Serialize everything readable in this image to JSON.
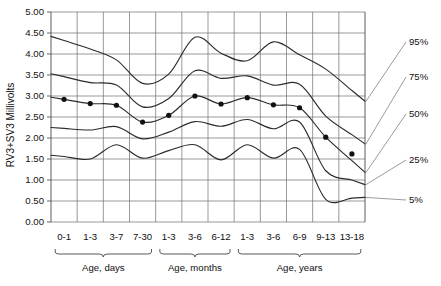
{
  "chart_data": {
    "type": "line",
    "title": "",
    "xlabel": "",
    "ylabel": "RV3+SV3 Millivolts",
    "ylim": [
      0.0,
      5.0
    ],
    "ytick_step": 0.5,
    "grid": true,
    "legend_position": "right-annotations",
    "categories": [
      "0-1",
      "1-3",
      "3-7",
      "7-30",
      "1-3",
      "3-6",
      "6-12",
      "1-3",
      "3-6",
      "6-9",
      "9-13",
      "13-18"
    ],
    "category_groups": [
      {
        "label": "Age, days",
        "categories": [
          "0-1",
          "1-3",
          "3-7",
          "7-30"
        ],
        "start_index": 0,
        "end_index": 3
      },
      {
        "label": "Age, months",
        "categories": [
          "1-3",
          "3-6",
          "6-12"
        ],
        "start_index": 4,
        "end_index": 6
      },
      {
        "label": "Age, years",
        "categories": [
          "1-3",
          "3-6",
          "6-9",
          "9-13",
          "13-18"
        ],
        "start_index": 7,
        "end_index": 11
      }
    ],
    "yticks": [
      "0.00",
      "0.50",
      "1.00",
      "1.50",
      "2.00",
      "2.50",
      "3.00",
      "3.50",
      "4.00",
      "4.50",
      "5.00"
    ],
    "series": [
      {
        "name": "95%",
        "label": "95%",
        "values": [
          4.32,
          4.12,
          3.86,
          3.3,
          3.52,
          4.4,
          4.02,
          3.84,
          4.29,
          3.98,
          3.64,
          3.13
        ]
      },
      {
        "name": "75%",
        "label": "75%",
        "values": [
          3.46,
          3.32,
          3.26,
          2.74,
          2.94,
          3.6,
          3.42,
          3.48,
          3.26,
          3.28,
          2.52,
          2.08
        ]
      },
      {
        "name": "50%",
        "label": "50%",
        "values": [
          2.92,
          2.82,
          2.78,
          2.38,
          2.54,
          3.0,
          2.81,
          2.96,
          2.79,
          2.72,
          2.02,
          1.46
        ]
      },
      {
        "name": "25%",
        "label": "25%",
        "values": [
          2.23,
          2.19,
          2.27,
          1.98,
          2.14,
          2.39,
          2.28,
          2.44,
          2.22,
          2.38,
          1.22,
          1.0
        ]
      },
      {
        "name": "5%",
        "label": "5%",
        "values": [
          1.56,
          1.5,
          1.84,
          1.52,
          1.7,
          1.84,
          1.48,
          1.84,
          1.52,
          1.73,
          0.54,
          0.57
        ]
      }
    ],
    "markers": {
      "series": "50%",
      "values": [
        2.92,
        2.82,
        2.78,
        2.38,
        2.54,
        3.0,
        2.81,
        2.96,
        2.79,
        2.72,
        2.02,
        1.62
      ]
    },
    "annotations": [
      {
        "text": "95%",
        "series": "95%"
      },
      {
        "text": "75%",
        "series": "75%"
      },
      {
        "text": "50%",
        "series": "50%"
      },
      {
        "text": "25%",
        "series": "25%"
      },
      {
        "text": "5%",
        "series": "5%"
      }
    ]
  }
}
